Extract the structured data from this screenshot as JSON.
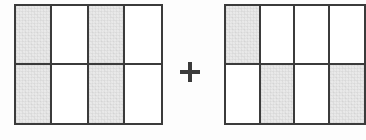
{
  "figure": {
    "type": "fraction-area-model-addition",
    "background_color": "#fdfdfd",
    "shade_color": "#e9e9e9",
    "line_color": "#3b3b3b",
    "operator": {
      "name": "plus",
      "symbol": "+",
      "label": "plus"
    },
    "models": [
      {
        "id": "left",
        "label": "left fraction model",
        "rows": 2,
        "columns": 4,
        "total_parts": 8,
        "shaded_parts": 4,
        "fraction": "4/8",
        "cells": [
          [
            {
              "index": 1,
              "shaded": true,
              "state": "shaded"
            },
            {
              "index": 2,
              "shaded": false,
              "state": "unshaded"
            },
            {
              "index": 3,
              "shaded": true,
              "state": "shaded"
            },
            {
              "index": 4,
              "shaded": false,
              "state": "unshaded"
            }
          ],
          [
            {
              "index": 5,
              "shaded": true,
              "state": "shaded"
            },
            {
              "index": 6,
              "shaded": false,
              "state": "unshaded"
            },
            {
              "index": 7,
              "shaded": true,
              "state": "shaded"
            },
            {
              "index": 8,
              "shaded": false,
              "state": "unshaded"
            }
          ]
        ]
      },
      {
        "id": "right",
        "label": "right fraction model",
        "rows": 2,
        "columns": 4,
        "total_parts": 8,
        "shaded_parts": 3,
        "fraction": "3/8",
        "cropped_at_right_edge": true,
        "cells": [
          [
            {
              "index": 1,
              "shaded": true,
              "state": "shaded"
            },
            {
              "index": 2,
              "shaded": false,
              "state": "unshaded"
            },
            {
              "index": 3,
              "shaded": false,
              "state": "unshaded"
            },
            {
              "index": 4,
              "shaded": false,
              "state": "unshaded"
            }
          ],
          [
            {
              "index": 5,
              "shaded": false,
              "state": "unshaded"
            },
            {
              "index": 6,
              "shaded": true,
              "state": "shaded"
            },
            {
              "index": 7,
              "shaded": false,
              "state": "unshaded"
            },
            {
              "index": 8,
              "shaded": true,
              "state": "shaded"
            }
          ]
        ]
      }
    ]
  }
}
